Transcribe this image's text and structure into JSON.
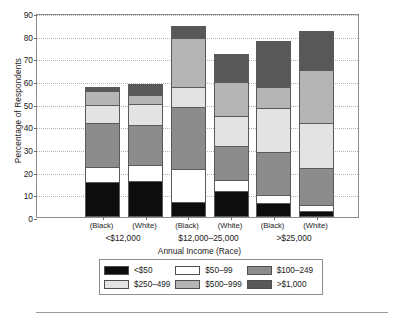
{
  "chart_data": {
    "type": "bar",
    "subtype": "stacked-bar-grouped",
    "title": "",
    "xlabel": "Annual Income (Race)",
    "ylabel": "Percentage of Respondents",
    "ylim": [
      0,
      90
    ],
    "yticks": [
      0,
      10,
      20,
      30,
      40,
      50,
      60,
      70,
      80,
      90
    ],
    "grid": true,
    "legend_position": "bottom",
    "group_labels": [
      "<$12,000",
      "$12,000–25,000",
      ">$25,000"
    ],
    "categories": [
      "(Black)",
      "(White)",
      "(Black)",
      "(White)",
      "(Black)",
      "(White)"
    ],
    "bars": [
      {
        "group": "<$12,000",
        "race": "(Black)",
        "total": 57.5,
        "values": [
          15.5,
          6.5,
          19.5,
          8.0,
          6.0,
          2.0
        ]
      },
      {
        "group": "<$12,000",
        "race": "(White)",
        "total": 58.5,
        "values": [
          16.0,
          7.0,
          17.5,
          9.5,
          4.0,
          4.5
        ]
      },
      {
        "group": "$12,000–25,000",
        "race": "(Black)",
        "total": 84.5,
        "values": [
          6.5,
          14.5,
          27.5,
          9.0,
          21.5,
          5.5
        ]
      },
      {
        "group": "$12,000–25,000",
        "race": "(White)",
        "total": 72.0,
        "values": [
          11.5,
          5.0,
          15.0,
          13.0,
          15.0,
          12.5
        ]
      },
      {
        "group": ">$25,000",
        "race": "(Black)",
        "total": 77.5,
        "values": [
          6.0,
          3.5,
          19.0,
          19.5,
          9.5,
          20.0
        ]
      },
      {
        "group": ">$25,000",
        "race": "(White)",
        "total": 82.0,
        "values": [
          2.5,
          3.0,
          16.0,
          20.0,
          23.5,
          17.0
        ]
      }
    ],
    "series": [
      {
        "name": "<$50",
        "color": "#0d0d0d",
        "values": [
          15.5,
          16.0,
          6.5,
          11.5,
          6.0,
          2.5
        ]
      },
      {
        "name": "$50–99",
        "color": "#ffffff",
        "values": [
          6.5,
          7.0,
          14.5,
          5.0,
          3.5,
          3.0
        ]
      },
      {
        "name": "$100–249",
        "color": "#8c8c8c",
        "values": [
          19.5,
          17.5,
          27.5,
          15.0,
          19.0,
          16.0
        ]
      },
      {
        "name": "$250–499",
        "color": "#e3e3e3",
        "values": [
          8.0,
          9.5,
          9.0,
          13.0,
          19.5,
          20.0
        ]
      },
      {
        "name": "$500–999",
        "color": "#b5b5b5",
        "values": [
          6.0,
          4.0,
          21.5,
          15.0,
          9.5,
          23.5
        ]
      },
      {
        "name": ">$1,000",
        "color": "#585858",
        "values": [
          2.0,
          4.5,
          5.5,
          12.5,
          20.0,
          17.0
        ]
      }
    ]
  },
  "legend": {
    "rows": [
      [
        {
          "label": "<$50",
          "color": "#0d0d0d"
        },
        {
          "label": "$50–99",
          "color": "#ffffff"
        },
        {
          "label": "$100–249",
          "color": "#8c8c8c"
        }
      ],
      [
        {
          "label": "$250–499",
          "color": "#e3e3e3"
        },
        {
          "label": "$500–999",
          "color": "#b5b5b5"
        },
        {
          "label": ">$1,000",
          "color": "#585858"
        }
      ]
    ]
  }
}
